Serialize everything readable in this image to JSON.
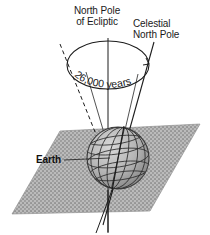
{
  "figure": {
    "background_color": "#ffffff",
    "ink_color": "#1c1c1c"
  },
  "labels": {
    "north_pole_of_ecliptic_line1": "North Pole",
    "north_pole_of_ecliptic_line2": "of Ecliptic",
    "celestial_north_pole_line1": "Celestial",
    "celestial_north_pole_line2": "North Pole",
    "earth": "Earth",
    "period": "26,000 years"
  },
  "diagram": {
    "cone_period_text": "26,000 years",
    "ecliptic_plane_fill": "#b2b2b2",
    "ecliptic_plane_name": "ecliptic-plane",
    "globe_name": "earth-globe",
    "globe_fill": "#a9a9a9",
    "axis_style_left": "dashed",
    "axis_style_center": "solid",
    "axis_style_right": "solid"
  }
}
